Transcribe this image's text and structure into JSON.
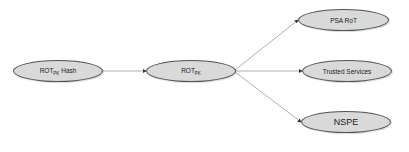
{
  "diagram": {
    "nodes": [
      {
        "id": "rot_hash",
        "label": "ROT",
        "sub": "PK",
        "suffix": " Hash"
      },
      {
        "id": "rot",
        "label": "ROT",
        "sub": "PK",
        "suffix": ""
      },
      {
        "id": "psa_rot",
        "label": "PSA RoT"
      },
      {
        "id": "trusted_services",
        "label": "Trusted Services"
      },
      {
        "id": "nspe",
        "label": "NSPE"
      }
    ],
    "edges": [
      {
        "from": "rot_hash",
        "to": "rot"
      },
      {
        "from": "rot",
        "to": "psa_rot"
      },
      {
        "from": "rot",
        "to": "trusted_services"
      },
      {
        "from": "rot",
        "to": "nspe"
      }
    ],
    "colors": {
      "node_fill": "#d9d9d9",
      "node_border": "#555555",
      "edge": "#888888"
    }
  }
}
